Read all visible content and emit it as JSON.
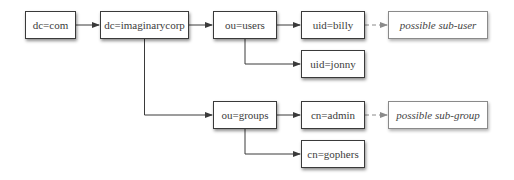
{
  "diagram": {
    "type": "tree",
    "title": "",
    "nodes": [
      {
        "id": "dc_com",
        "label": "dc=com",
        "kind": "entry",
        "x": 25,
        "y": 11,
        "w": 51,
        "h": 28
      },
      {
        "id": "dc_imaginarycorp",
        "label": "dc=imaginarycorp",
        "kind": "entry",
        "x": 100,
        "y": 11,
        "w": 89,
        "h": 28
      },
      {
        "id": "ou_users",
        "label": "ou=users",
        "kind": "entry",
        "x": 213,
        "y": 11,
        "w": 64,
        "h": 28
      },
      {
        "id": "uid_billy",
        "label": "uid=billy",
        "kind": "entry",
        "x": 301,
        "y": 11,
        "w": 64,
        "h": 28
      },
      {
        "id": "possible_sub_user",
        "label": "possible sub-user",
        "kind": "possible",
        "x": 388,
        "y": 11,
        "w": 100,
        "h": 28
      },
      {
        "id": "uid_jonny",
        "label": "uid=jonny",
        "kind": "entry",
        "x": 301,
        "y": 50,
        "w": 64,
        "h": 28
      },
      {
        "id": "ou_groups",
        "label": "ou=groups",
        "kind": "entry",
        "x": 213,
        "y": 101,
        "w": 64,
        "h": 28
      },
      {
        "id": "cn_admin",
        "label": "cn=admin",
        "kind": "entry",
        "x": 301,
        "y": 101,
        "w": 64,
        "h": 28
      },
      {
        "id": "possible_sub_group",
        "label": "possible sub-group",
        "kind": "possible",
        "x": 388,
        "y": 101,
        "w": 100,
        "h": 28
      },
      {
        "id": "cn_gophers",
        "label": "cn=gophers",
        "kind": "entry",
        "x": 301,
        "y": 140,
        "w": 64,
        "h": 28
      }
    ],
    "edges": [
      {
        "from": "dc_com",
        "to": "dc_imaginarycorp",
        "style": "solid"
      },
      {
        "from": "dc_imaginarycorp",
        "to": "ou_users",
        "style": "solid"
      },
      {
        "from": "dc_imaginarycorp",
        "to": "ou_groups",
        "style": "solid",
        "routing": "elbow-down"
      },
      {
        "from": "ou_users",
        "to": "uid_billy",
        "style": "solid"
      },
      {
        "from": "ou_users",
        "to": "uid_jonny",
        "style": "solid",
        "routing": "elbow-down"
      },
      {
        "from": "uid_billy",
        "to": "possible_sub_user",
        "style": "dashed"
      },
      {
        "from": "ou_groups",
        "to": "cn_admin",
        "style": "solid"
      },
      {
        "from": "ou_groups",
        "to": "cn_gophers",
        "style": "solid",
        "routing": "elbow-down"
      },
      {
        "from": "cn_admin",
        "to": "possible_sub_group",
        "style": "dashed"
      }
    ],
    "colors": {
      "solid_edge": "#3a3a3a",
      "dashed_edge": "#8a8a8a",
      "node_border": "#3a3a3a",
      "possible_border": "#8a8a8a"
    }
  }
}
